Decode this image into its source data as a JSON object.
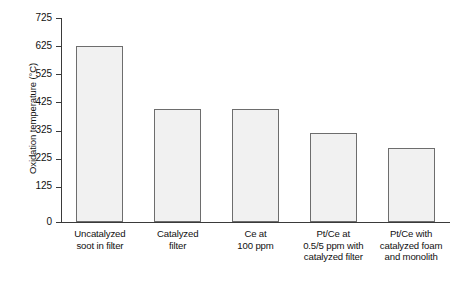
{
  "chart_data": {
    "type": "bar",
    "title": "",
    "subtitle": "",
    "xlabel": "",
    "ylabel": "Oxidation temperature (°C)",
    "categories": [
      "Uncatalyzed\nsoot in filter",
      "Catalyzed\nfilter",
      "Ce at\n100 ppm",
      "Pt/Ce at\n0.5/5 ppm with\ncatalyzed filter",
      "Pt/Ce with\ncatalyzed foam\nand monolith"
    ],
    "category_lines": [
      [
        "Uncatalyzed",
        "soot in filter"
      ],
      [
        "Catalyzed",
        "filter"
      ],
      [
        "Ce at",
        "100 ppm"
      ],
      [
        "Pt/Ce at",
        "0.5/5 ppm with",
        "catalyzed filter"
      ],
      [
        "Pt/Ce with",
        "catalyzed foam",
        "and monolith"
      ]
    ],
    "values": [
      625,
      400,
      400,
      318,
      262
    ],
    "ylim": [
      0,
      725
    ],
    "yticks": [
      0,
      125,
      225,
      325,
      425,
      525,
      625,
      725
    ],
    "ytick_labels": [
      "0",
      "125",
      "225",
      "325",
      "425",
      "525",
      "625",
      "725"
    ],
    "grid": false,
    "legend": null,
    "bar_fill_color": "#f1f1f1",
    "bar_edge_color": "#6d6d6d",
    "axis_color": "#3a3a3a",
    "background_color": "#ffffff"
  }
}
